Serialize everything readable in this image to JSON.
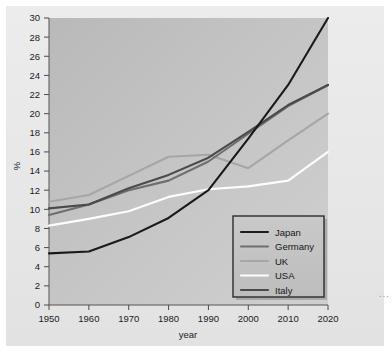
{
  "chart_data": {
    "type": "line",
    "title": "",
    "xlabel": "year",
    "ylabel": "%",
    "x": [
      1950,
      1960,
      1970,
      1980,
      1990,
      2000,
      2010,
      2020
    ],
    "xlim": [
      1950,
      2020
    ],
    "ylim": [
      0,
      30
    ],
    "xticks": [
      "1950",
      "1960",
      "1970",
      "1980",
      "1990",
      "2000",
      "2010",
      "2020"
    ],
    "yticks": [
      "0",
      "2",
      "4",
      "6",
      "8",
      "10",
      "12",
      "14",
      "16",
      "18",
      "20",
      "22",
      "24",
      "26",
      "28",
      "30"
    ],
    "grid": false,
    "legend_position": "bottom-right",
    "series": [
      {
        "name": "Japan",
        "color": "#1a1a1a",
        "values": [
          5.4,
          5.6,
          7.1,
          9.1,
          12.0,
          17.4,
          23.0,
          30.0
        ]
      },
      {
        "name": "Germany",
        "color": "#6e6e6e",
        "values": [
          9.4,
          10.5,
          12.0,
          13.0,
          15.0,
          17.9,
          20.8,
          23.0
        ]
      },
      {
        "name": "UK",
        "color": "#a6a6a6",
        "values": [
          10.8,
          11.5,
          13.5,
          15.5,
          15.7,
          14.3,
          17.2,
          20.0
        ]
      },
      {
        "name": "USA",
        "color": "#fdfdfd",
        "values": [
          8.3,
          9.0,
          9.8,
          11.3,
          12.1,
          12.4,
          13.0,
          16.0
        ]
      },
      {
        "name": "Italy",
        "color": "#4a4a4a",
        "values": [
          10.1,
          10.5,
          12.2,
          13.6,
          15.4,
          18.1,
          20.9,
          23.0
        ]
      }
    ]
  },
  "axes": {
    "y_axis_label": "%",
    "x_axis_label": "year"
  },
  "legend": {
    "entries": [
      {
        "label": "Japan"
      },
      {
        "label": "Germany"
      },
      {
        "label": "UK"
      },
      {
        "label": "USA"
      },
      {
        "label": "Italy"
      }
    ]
  },
  "margin_note": "..."
}
